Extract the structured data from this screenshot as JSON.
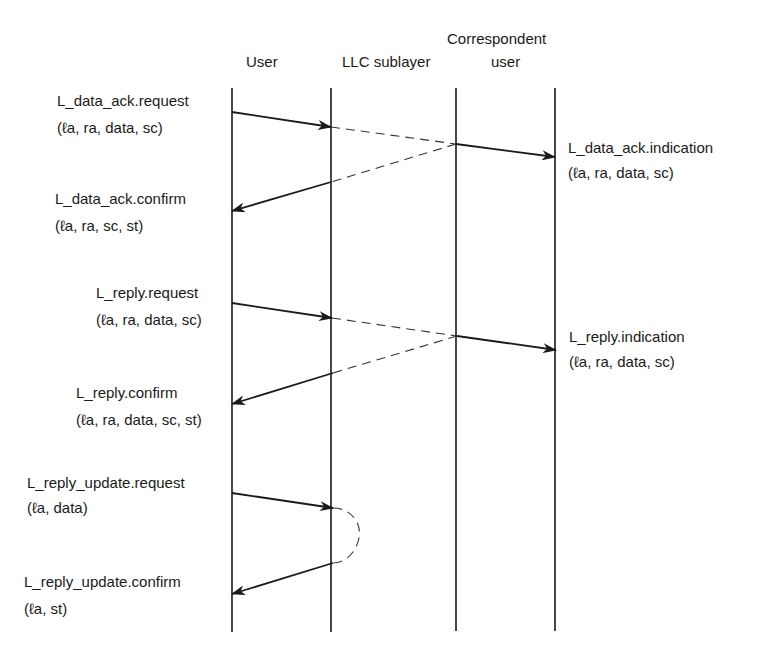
{
  "headers": {
    "user": "User",
    "llc": "LLC sublayer",
    "correspondent_line1": "Correspondent",
    "correspondent_line2": "user"
  },
  "lifelines": {
    "user_x": 232,
    "llc_x": 331,
    "corr_llc_x": 456,
    "corr_user_x": 555,
    "top_y": 88,
    "bottom_y": 632
  },
  "primitives": [
    {
      "id": "data-ack-request",
      "name": "L_data_ack.request",
      "params": "(ℓa, ra, data, sc)"
    },
    {
      "id": "data-ack-indication",
      "name": "L_data_ack.indication",
      "params": "(ℓa, ra, data, sc)"
    },
    {
      "id": "data-ack-confirm",
      "name": "L_data_ack.confirm",
      "params": "(ℓa, ra, sc, st)"
    },
    {
      "id": "reply-request",
      "name": "L_reply.request",
      "params": "(ℓa, ra, data, sc)"
    },
    {
      "id": "reply-indication",
      "name": "L_reply.indication",
      "params": "(ℓa, ra, data, sc)"
    },
    {
      "id": "reply-confirm",
      "name": "L_reply.confirm",
      "params": "(ℓa, ra, data, sc, st)"
    },
    {
      "id": "reply-update-request",
      "name": "L_reply_update.request",
      "params": "(ℓa, data)"
    },
    {
      "id": "reply-update-confirm",
      "name": "L_reply_update.confirm",
      "params": "(ℓa, st)"
    }
  ]
}
